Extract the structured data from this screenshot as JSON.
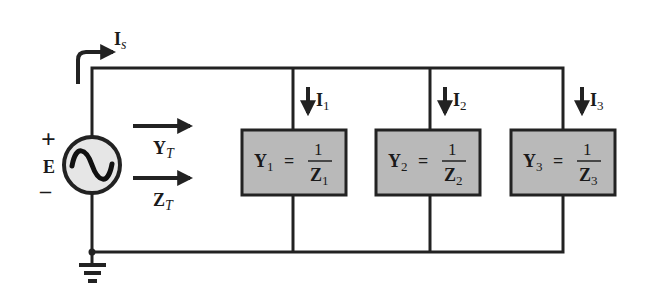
{
  "diagram": {
    "type": "parallel AC circuit",
    "colors": {
      "wire": "#222222",
      "branch_fill": "#b9b9b9",
      "source_fill": "#e6e6e6",
      "background": "#ffffff"
    },
    "source": {
      "label": "E",
      "plus": "+",
      "minus": "–",
      "symbol": "sine-wave",
      "current": {
        "main": "I",
        "sub": "s"
      }
    },
    "totals": {
      "admittance": {
        "main": "Y",
        "sub": "T"
      },
      "impedance": {
        "main": "Z",
        "sub": "T"
      }
    },
    "branches": [
      {
        "current": {
          "main": "I",
          "sub": "1"
        },
        "y": {
          "main": "Y",
          "sub": "1"
        },
        "eq": "=",
        "num": "1",
        "z": {
          "main": "Z",
          "sub": "1"
        }
      },
      {
        "current": {
          "main": "I",
          "sub": "2"
        },
        "y": {
          "main": "Y",
          "sub": "2"
        },
        "eq": "=",
        "num": "1",
        "z": {
          "main": "Z",
          "sub": "2"
        }
      },
      {
        "current": {
          "main": "I",
          "sub": "3"
        },
        "y": {
          "main": "Y",
          "sub": "3"
        },
        "eq": "=",
        "num": "1",
        "z": {
          "main": "Z",
          "sub": "3"
        }
      }
    ]
  }
}
